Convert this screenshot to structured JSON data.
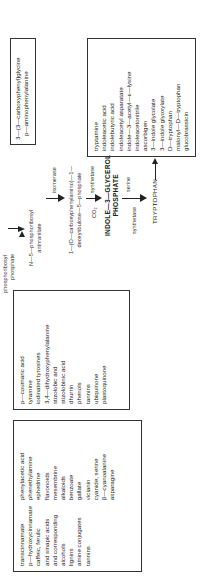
{
  "box_phenylpropanoids": {
    "col1": [
      "transcinnamate",
      "p—hydroxycinnamate",
      "caffeic, ferulic",
      "and sinapic acids",
      "and corresponding",
      "alcohols",
      "lignins",
      "amine conjugates",
      "tannins"
    ],
    "col2": [
      "phenylacetic acid",
      "phenethylamine",
      "ephedrine",
      "flavonoids",
      "mesembrine",
      "alkaloids",
      "benzoate",
      "gallate",
      "vicianin",
      "cyanide, serine",
      "β—cyanoalanine",
      "asparagine"
    ]
  },
  "box_tyrosine_products": {
    "items": [
      "p—coumaric acid",
      "tyramine",
      "iodinated tyrosines",
      "3,4—dihydroxyphenylalanine",
      "stizolobic and",
      "stizolobinic acid",
      "dhurrin",
      "phenols",
      "tannins",
      "ubiquinone",
      "plastoquinone"
    ]
  },
  "pathway": {
    "phosphoribosyl_phosphate": [
      "phosphoribosyl",
      "phosphate"
    ],
    "n5_phosphoribosyl_anthranilate": [
      "N—5—phosphoribosyl",
      "anthranilate"
    ],
    "isomerase": "isomerase",
    "cdrp": [
      "1—(O—carboxyphenylamino)—1—",
      "deoxyribulose—5—phosphate"
    ],
    "co2": "CO₂",
    "synthetase_1": "synthetase",
    "igp": [
      "INDOLE—3—GLYCEROL",
      "PHOSPHATE"
    ],
    "synthetase_2": "synthetase",
    "serine": "serine",
    "tryptophan": "TRYPTOPHAN"
  },
  "box_tryptophan_products": {
    "items": [
      "tryptamine",
      "indoleacetic acid",
      "indolebutyric acid",
      "indoleacetyl asparatate",
      "indole—3—acetyl—ε—lysine",
      "indoleacetonitrile",
      "ascorbigen",
      "3—indole glycolate",
      "3—indole glyoxylate",
      "D—tryptophan",
      "malonyl—D—tryptophan",
      "glucobrassicin"
    ]
  },
  "box_other": {
    "items": [
      "3—(3—carboxyphenyl)glycine",
      "p—aminophenylalanine"
    ]
  }
}
